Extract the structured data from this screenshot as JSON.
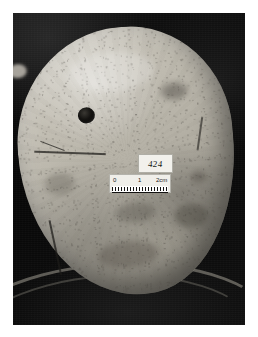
{
  "page": {
    "kind": "archaeological-specimen-photograph",
    "background_color": "#ffffff",
    "width": 258,
    "height": 337
  },
  "photo": {
    "frame_color": "#0a0a0a",
    "left": 13,
    "top": 13,
    "width": 232,
    "height": 312,
    "subject": "cranium",
    "background_description": "dark black photographic background"
  },
  "specimen": {
    "name": "skull-cranium",
    "surface_color": "#c2beb3",
    "shadow_color": "#8d8a80",
    "features": {
      "perforation": "circular-hole",
      "fissure": "cranial-suture-line",
      "fracture": "edge-fracture"
    }
  },
  "spec_label": {
    "name": "specimen-number-label",
    "text": "424",
    "card_color": "#f2f1ec",
    "ink_color": "#201e1b"
  },
  "scale_bar": {
    "name": "scale-bar",
    "card_color": "#efeee9",
    "tick_color": "#141312",
    "ticks": [
      {
        "label": "0"
      },
      {
        "label": "1"
      },
      {
        "label": "2cm"
      }
    ],
    "unit": "cm",
    "max_value": 2
  }
}
